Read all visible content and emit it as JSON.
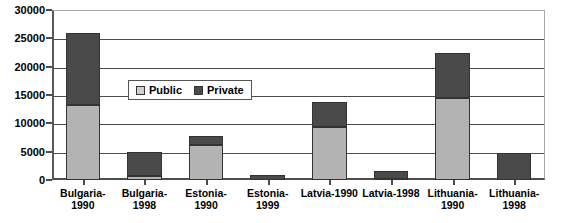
{
  "chart_data": {
    "type": "bar",
    "subtype": "stacked",
    "title": "",
    "xlabel": "",
    "ylabel": "",
    "ylim": [
      0,
      30000
    ],
    "ytick_step": 5000,
    "yticks": [
      "0",
      "5000",
      "10000",
      "15000",
      "20000",
      "25000",
      "30000"
    ],
    "ytick_values": [
      0,
      5000,
      10000,
      15000,
      20000,
      25000,
      30000
    ],
    "grid": true,
    "grid_axis": "y",
    "legend": {
      "position": "inside-upper-left",
      "entries": [
        {
          "label": "Public",
          "color": "#cfcfcf"
        },
        {
          "label": "Private",
          "color": "#4a4a4a"
        }
      ]
    },
    "categories": [
      "Bulgaria-1990",
      "Bulgaria-1998",
      "Estonia-1990",
      "Estonia-1999",
      "Latvia-1990",
      "Latvia-1998",
      "Lithuania-1990",
      "Lithuania-1998"
    ],
    "category_lines": [
      [
        "Bulgaria-",
        "1990"
      ],
      [
        "Bulgaria-",
        "1998"
      ],
      [
        "Estonia-",
        "1990"
      ],
      [
        "Estonia-",
        "1999"
      ],
      [
        "Latvia-1990",
        ""
      ],
      [
        "Latvia-1998",
        ""
      ],
      [
        "Lithuania-",
        "1990"
      ],
      [
        "Lithuania-",
        "1998"
      ]
    ],
    "series": [
      {
        "name": "Public",
        "color": "#b3b3b3",
        "values": [
          13200,
          700,
          6200,
          0,
          9300,
          200,
          14400,
          0
        ]
      },
      {
        "name": "Private",
        "color": "#4a4a4a",
        "values": [
          12800,
          4300,
          1500,
          800,
          4500,
          1400,
          8100,
          4700
        ]
      }
    ],
    "totals": [
      26000,
      5000,
      7700,
      800,
      13800,
      1600,
      22500,
      4700
    ]
  }
}
